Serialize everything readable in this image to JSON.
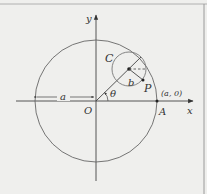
{
  "diagram": {
    "axes": {
      "x_label": "x",
      "y_label": "y",
      "origin_label": "O"
    },
    "big_circle": {
      "radius_label": "a",
      "point_label": "A",
      "point_coord": "(a, 0)"
    },
    "small_circle": {
      "label": "C",
      "radius_label": "b",
      "point_label": "P"
    },
    "angle_label": "θ",
    "colors": {
      "line": "#4a4a4a",
      "circle": "#6a6a6a",
      "background": "#efefed",
      "frame": "#9a9a9a"
    }
  }
}
